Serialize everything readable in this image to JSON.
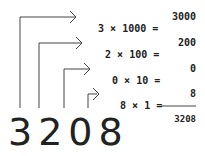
{
  "number": "3208",
  "rows": [
    {
      "digit": "3",
      "op": "×",
      "place": "1000",
      "eq": "=",
      "result": "3000"
    },
    {
      "digit": "2",
      "op": "×",
      "place": "100",
      "eq": "=",
      "result": "200"
    },
    {
      "digit": "0",
      "op": "×",
      "place": "10",
      "eq": "=",
      "result": "0"
    },
    {
      "digit": "8",
      "op": "×",
      "place": "1",
      "eq": "=",
      "result": "8"
    }
  ],
  "total": "3208",
  "colors": {
    "stroke": "#444444",
    "text": "#222222",
    "background": "#ffffff"
  }
}
